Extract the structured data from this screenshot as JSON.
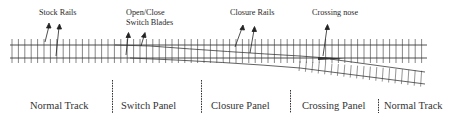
{
  "diagram": {
    "type": "railway-turnout-schematic",
    "colors": {
      "rail": "#3a3a3a",
      "sleeper": "#555555",
      "divider": "#333333",
      "text": "#2a2a2a",
      "background": "#ffffff"
    },
    "component_labels": [
      {
        "id": "stock-rails",
        "text": "Stock Rails"
      },
      {
        "id": "switch-blades",
        "line1": "Open/Close",
        "line2": "Switch Blades"
      },
      {
        "id": "closure-rails",
        "text": "Closure Rails"
      },
      {
        "id": "crossing-nose",
        "text": "Crossing nose"
      }
    ],
    "panels": [
      {
        "id": "normal-track-1",
        "label": "Normal Track"
      },
      {
        "id": "switch-panel",
        "label": "Switch Panel"
      },
      {
        "id": "closure-panel",
        "label": "Closure Panel"
      },
      {
        "id": "crossing-panel",
        "label": "Crossing Panel"
      },
      {
        "id": "normal-track-2",
        "label": "Normal Track"
      }
    ]
  }
}
